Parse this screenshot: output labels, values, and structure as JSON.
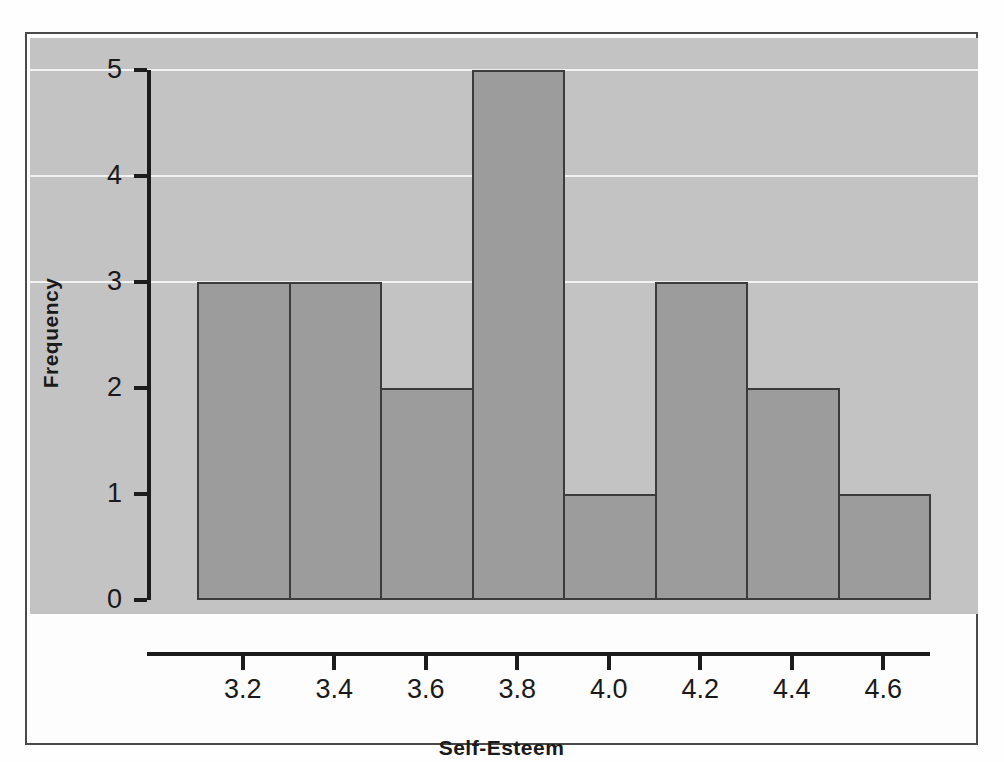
{
  "chart_data": {
    "type": "bar",
    "title": "",
    "subtitle": "",
    "xlabel": "Self-Esteem",
    "ylabel": "Frequency",
    "categories": [
      "3.1-3.3",
      "3.3-3.5",
      "3.5-3.7",
      "3.7-3.9",
      "3.9-4.1",
      "4.1-4.3",
      "4.3-4.5",
      "4.5-4.7"
    ],
    "bin_edges": [
      3.1,
      3.3,
      3.5,
      3.7,
      3.9,
      4.1,
      4.3,
      4.5,
      4.7
    ],
    "bin_width": 0.2,
    "values": [
      3,
      3,
      2,
      5,
      1,
      3,
      2,
      1
    ],
    "total_count": 20,
    "xlim": [
      3.05,
      4.72
    ],
    "ylim": [
      0,
      5
    ],
    "x_ticks": [
      3.2,
      3.4,
      3.6,
      3.8,
      4.0,
      4.2,
      4.4,
      4.6
    ],
    "x_tick_labels": [
      "3.2",
      "3.4",
      "3.6",
      "3.8",
      "4.0",
      "4.2",
      "4.4",
      "4.6"
    ],
    "y_ticks": [
      0,
      1,
      2,
      3,
      4,
      5
    ],
    "y_tick_labels": [
      "0",
      "1",
      "2",
      "3",
      "4",
      "5"
    ],
    "grid": "horizontal-white-gridlines-at-3-4-5",
    "legend": "none",
    "annotations": []
  },
  "style": {
    "panel_background": "#c3c3c3",
    "bar_fill": "#9c9c9c",
    "bar_edge": "#3b3b3b",
    "gridline_color": "#f2f2f2",
    "axis_color": "#1c1c1c",
    "text_color": "#1a1a1a",
    "frame_border": "#4a4a4a",
    "page_background": "#fefefe"
  }
}
